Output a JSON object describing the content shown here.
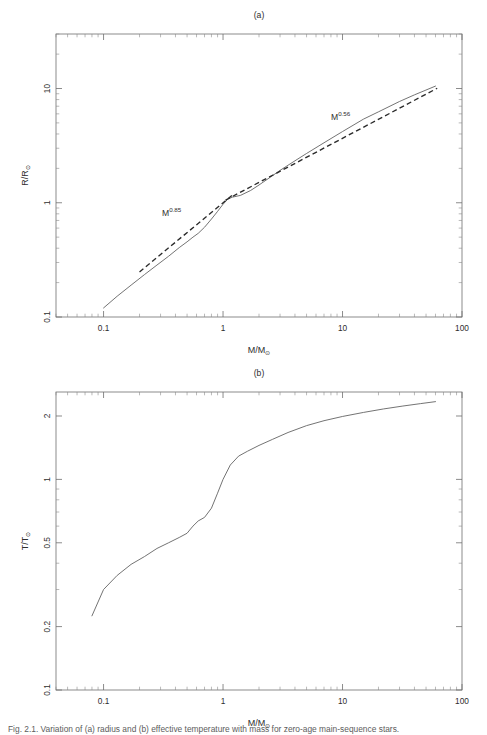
{
  "figure": {
    "caption": "Fig. 2.1.   Variation of (a) radius and (b) effective temperature with mass for zero-age main-sequence stars."
  },
  "panels": [
    {
      "id": "a",
      "title": "(a)",
      "xlabel_main": "M/M",
      "xlabel_sub": "⊙",
      "ylabel_main": "R/R",
      "ylabel_sub": "⊙",
      "x_ticklabels": [
        "0.1",
        "1",
        "10",
        "100"
      ],
      "y_ticklabels": [
        "10",
        "1",
        "0.1"
      ],
      "annotations": [
        {
          "name": "low-mass-powerlaw-label",
          "base": "M",
          "exponent": "0.85",
          "x": 162,
          "y": 216
        },
        {
          "name": "high-mass-powerlaw-label",
          "base": "M",
          "exponent": "0.56",
          "x": 331,
          "y": 120
        }
      ]
    },
    {
      "id": "b",
      "title": "(b)",
      "xlabel_main": "M/M",
      "xlabel_sub": "⊙",
      "ylabel_main": "T/T",
      "ylabel_sub": "⊙",
      "x_ticklabels": [
        "0.1",
        "1",
        "10",
        "100"
      ],
      "y_ticklabels": [
        "2",
        "1",
        "0.5",
        "0.2",
        "0.1"
      ],
      "annotations": []
    }
  ],
  "chart_data": [
    {
      "type": "line",
      "title": "(a)",
      "xlabel": "M/M⊙",
      "ylabel": "R/R⊙",
      "xscale": "log",
      "yscale": "log",
      "xlim": [
        0.04,
        100
      ],
      "ylim": [
        0.1,
        30
      ],
      "xticks": [
        0.1,
        1,
        10,
        100
      ],
      "yticks": [
        0.1,
        1,
        10
      ],
      "grid": false,
      "legend": "none",
      "annotations": [
        {
          "text": "M^0.56",
          "x": 9.0,
          "y": 4.0
        },
        {
          "text": "M^0.85",
          "x": 0.42,
          "y": 0.63
        }
      ],
      "series": [
        {
          "name": "ZAMS radius (model)",
          "style": "solid",
          "x": [
            0.1,
            0.13,
            0.17,
            0.22,
            0.28,
            0.35,
            0.43,
            0.5,
            0.56,
            0.62,
            0.7,
            0.8,
            0.9,
            1.0,
            1.1,
            1.2,
            1.4,
            1.7,
            2.0,
            2.5,
            3.0,
            4.0,
            5.0,
            7.0,
            10.0,
            15.0,
            20.0,
            30.0,
            40.0,
            60.0
          ],
          "y": [
            0.12,
            0.152,
            0.19,
            0.235,
            0.285,
            0.34,
            0.405,
            0.455,
            0.5,
            0.54,
            0.61,
            0.72,
            0.84,
            0.97,
            1.08,
            1.12,
            1.16,
            1.28,
            1.43,
            1.68,
            1.92,
            2.33,
            2.7,
            3.35,
            4.2,
            5.4,
            6.25,
            7.7,
            8.8,
            10.5
          ]
        },
        {
          "name": "M^0.85 power-law fit",
          "style": "dashed",
          "x": [
            0.2,
            1.22
          ],
          "y": [
            0.248,
            1.185
          ]
        },
        {
          "name": "M^0.56 power-law fit",
          "style": "dashed",
          "x": [
            1.05,
            62.0
          ],
          "y": [
            1.055,
            10.05
          ]
        }
      ]
    },
    {
      "type": "line",
      "title": "(b)",
      "xlabel": "M/M⊙",
      "ylabel": "T/T⊙",
      "xscale": "log",
      "yscale": "log",
      "xlim": [
        0.04,
        100
      ],
      "ylim": [
        0.1,
        2.6
      ],
      "xticks": [
        0.1,
        1,
        10,
        100
      ],
      "yticks": [
        0.1,
        0.2,
        0.5,
        1,
        2
      ],
      "grid": false,
      "legend": "none",
      "series": [
        {
          "name": "ZAMS effective temperature (model)",
          "style": "solid",
          "x": [
            0.08,
            0.1,
            0.13,
            0.17,
            0.22,
            0.28,
            0.35,
            0.43,
            0.5,
            0.56,
            0.62,
            0.7,
            0.8,
            0.9,
            1.0,
            1.15,
            1.35,
            1.6,
            2.0,
            2.6,
            3.5,
            5.0,
            7.0,
            10.0,
            15.0,
            22.0,
            32.0,
            45.0,
            60.0
          ],
          "y": [
            0.225,
            0.3,
            0.35,
            0.395,
            0.43,
            0.47,
            0.5,
            0.53,
            0.555,
            0.6,
            0.635,
            0.66,
            0.73,
            0.86,
            1.0,
            1.17,
            1.29,
            1.36,
            1.45,
            1.55,
            1.67,
            1.8,
            1.9,
            1.99,
            2.08,
            2.16,
            2.23,
            2.29,
            2.34
          ]
        }
      ]
    }
  ]
}
